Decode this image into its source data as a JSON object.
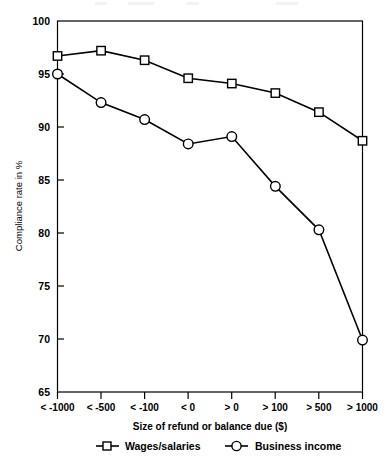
{
  "chart_data": {
    "type": "line",
    "title": "",
    "subtitle": "",
    "xlabel": "Size of refund or balance due ($)",
    "ylabel": "Compliance rate in %",
    "categories": [
      "< -1000",
      "< -500",
      "< -100",
      "< 0",
      "> 0",
      "> 100",
      "> 500",
      "> 1000"
    ],
    "ylim": [
      65,
      100
    ],
    "yticks": [
      65,
      70,
      75,
      80,
      85,
      90,
      95,
      100
    ],
    "ytick_labels": [
      "65",
      "70",
      "75",
      "80",
      "85",
      "90",
      "95",
      "100"
    ],
    "grid": false,
    "legend_position": "bottom",
    "series": [
      {
        "name": "Wages/salaries",
        "marker": "square",
        "values": [
          96.7,
          97.2,
          96.3,
          94.6,
          94.1,
          93.2,
          91.4,
          88.7
        ]
      },
      {
        "name": "Business income",
        "marker": "circle",
        "values": [
          95.0,
          92.3,
          90.7,
          88.4,
          89.1,
          84.4,
          80.3,
          69.9
        ]
      }
    ]
  },
  "axes": {
    "y_axis_label": "Compliance rate in %",
    "x_axis_label": "Size of refund or balance due ($)",
    "y_tick_labels": [
      "100",
      "95",
      "90",
      "85",
      "80",
      "75",
      "70",
      "65"
    ],
    "x_tick_labels": [
      "< -1000",
      "< -500",
      "< -100",
      "< 0",
      "> 0",
      "> 100",
      "> 500",
      "> 1000"
    ]
  },
  "legend": {
    "entries": [
      {
        "label": "Wages/salaries",
        "marker": "square-marker-icon"
      },
      {
        "label": "Business income",
        "marker": "circle-marker-icon"
      }
    ]
  }
}
